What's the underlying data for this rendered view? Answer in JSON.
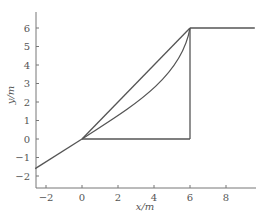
{
  "chart_data": {
    "type": "line",
    "title": "",
    "xlabel": "x/m",
    "ylabel": "y/m",
    "xlim": [
      -2.6,
      9.6
    ],
    "ylim": [
      -2.6,
      6.9
    ],
    "xticks": [
      -2,
      0,
      2,
      4,
      6,
      8
    ],
    "yticks": [
      -2,
      -1,
      0,
      1,
      2,
      3,
      4,
      5,
      6
    ],
    "grid": false,
    "legend": null,
    "series": [
      {
        "name": "approach-line",
        "x": [
          -2.6,
          0
        ],
        "y": [
          -1.6,
          0
        ]
      },
      {
        "name": "straight-diagonal",
        "x": [
          0,
          6
        ],
        "y": [
          0,
          6
        ]
      },
      {
        "name": "curved-path",
        "x": [
          0,
          1,
          2,
          3,
          4,
          5,
          5.6,
          6
        ],
        "y": [
          0,
          0.7,
          1.5,
          2.3,
          3.2,
          4.2,
          5.0,
          6
        ]
      },
      {
        "name": "horizontal-base",
        "x": [
          0,
          6
        ],
        "y": [
          0,
          0
        ]
      },
      {
        "name": "vertical-side",
        "x": [
          6,
          6
        ],
        "y": [
          0,
          6
        ]
      },
      {
        "name": "top-horizontal",
        "x": [
          6,
          9.6
        ],
        "y": [
          6,
          6
        ]
      }
    ]
  },
  "colors": {
    "line": "#555555",
    "axis": "#777777"
  }
}
